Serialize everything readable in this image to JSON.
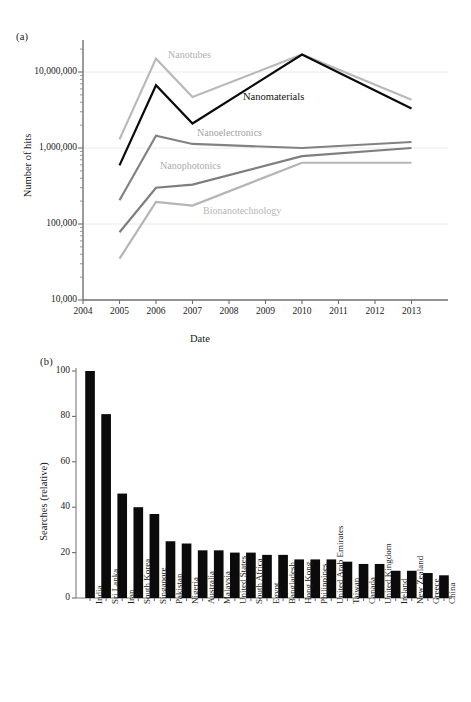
{
  "figure": {
    "panel_a_tag": "(a)",
    "panel_b_tag": "(b)"
  },
  "chart_data": [
    {
      "type": "line",
      "panel": "(a)",
      "title": "",
      "xlabel": "Date",
      "ylabel": "Number of hits",
      "yscale": "log",
      "ylim": [
        10000,
        30000000
      ],
      "xlim": [
        2004,
        2014
      ],
      "grid": true,
      "grid_axis": "y",
      "legend_position": "inline-annotations",
      "x_tick_labels": [
        "2004",
        "2005",
        "2006",
        "2007",
        "2008",
        "2009",
        "2010",
        "2011",
        "2012",
        "2013"
      ],
      "y_tick_labels": [
        "10,000",
        "100,000",
        "1,000,000",
        "10,000,000"
      ],
      "y_tick_values": [
        10000,
        100000,
        1000000,
        10000000
      ],
      "x": [
        2005,
        2006,
        2007,
        2010,
        2013
      ],
      "series": [
        {
          "name": "Nanotubes",
          "color": "#b9b9b9",
          "label_color": "#b0b0b0",
          "values": [
            1300000,
            15000000,
            4700000,
            17000000,
            4300000
          ]
        },
        {
          "name": "Nanomaterials",
          "color": "#0a0a0a",
          "label_color": "#111111",
          "values": [
            590000,
            6700000,
            2100000,
            17000000,
            3300000
          ]
        },
        {
          "name": "Nanoelectronics",
          "color": "#828282",
          "label_color": "#a3a3a3",
          "values": [
            205000,
            1450000,
            1130000,
            1000000,
            1200000
          ]
        },
        {
          "name": "Nanophotonics",
          "color": "#7e7e7e",
          "label_color": "#ababab",
          "values": [
            78000,
            300000,
            330000,
            780000,
            1000000
          ]
        },
        {
          "name": "Bionanotechnology",
          "color": "#b5b5b5",
          "label_color": "#b6b6b6",
          "values": [
            35000,
            195000,
            175000,
            640000,
            640000
          ]
        }
      ]
    },
    {
      "type": "bar",
      "panel": "(b)",
      "title": "",
      "xlabel": "",
      "ylabel": "Searches (relative)",
      "ylim": [
        0,
        100
      ],
      "y_tick_labels": [
        "0",
        "20",
        "40",
        "60",
        "80",
        "100"
      ],
      "y_tick_values": [
        0,
        20,
        40,
        60,
        80,
        100
      ],
      "grid": false,
      "bar_color": "#0b0b0b",
      "categories": [
        "India",
        "Sri Lanka",
        "Iran",
        "South Korea",
        "Singapore",
        "Pakistan",
        "Nigeria",
        "Australia",
        "Malaysia",
        "United States",
        "South Africa",
        "Egypt",
        "Bangladesh",
        "Hong Kong",
        "Philippines",
        "United Arab Emirates",
        "Taiwan",
        "Canada",
        "United Kingdom",
        "Ireland",
        "New Zealand",
        "Greece",
        "China"
      ],
      "values": [
        100,
        81,
        46,
        40,
        37,
        25,
        24,
        21,
        21,
        20,
        20,
        19,
        19,
        17,
        17,
        17,
        16,
        15,
        15,
        12,
        12,
        11,
        10
      ]
    }
  ]
}
